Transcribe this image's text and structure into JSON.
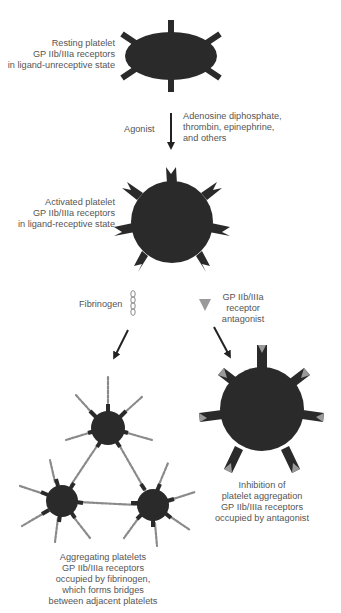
{
  "colors": {
    "platelet": "#2a2a2a",
    "antagonist": "#9a9a9a",
    "text": "#555555",
    "arrow": "#222222",
    "fibrinogen": "#888888"
  },
  "labels": {
    "resting": [
      "Resting platelet",
      "GP IIb/IIIa receptors",
      "in ligand-unreceptive state"
    ],
    "agonist": "Agonist",
    "agonist_examples": [
      "Adenosine diphosphate,",
      "thrombin, epinephrine,",
      "and others"
    ],
    "activated": [
      "Activated platelet",
      "GP IIb/IIIa receptors",
      "in ligand-receptive state"
    ],
    "fibrinogen": "Fibrinogen",
    "antagonist": [
      "GP IIb/IIIa",
      "receptor",
      "antagonist"
    ],
    "aggregating": [
      "Aggregating platelets",
      "GP IIb/IIIa receptors",
      "occupied by fibrinogen,",
      "which forms bridges",
      "between adjacent platelets"
    ],
    "inhibition": [
      "Inhibition of",
      "platelet aggregation",
      "GP IIb/IIIa receptors",
      "occupied by antagonist"
    ]
  },
  "icons": {
    "fibrinogen": "chain-links-icon",
    "antagonist": "inverted-triangle-icon"
  }
}
